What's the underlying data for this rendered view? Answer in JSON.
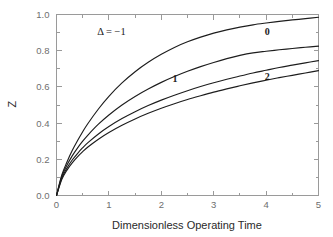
{
  "chart_data": {
    "type": "line",
    "title": "",
    "xlabel": "Dimensionless Operating Time",
    "ylabel": "Z",
    "xlim": [
      0,
      5
    ],
    "ylim": [
      0,
      1.0
    ],
    "grid": false,
    "legend": "inline-curve-labels",
    "x_ticks": [
      "0",
      "1",
      "2",
      "3",
      "4",
      "5"
    ],
    "x_tick_values": [
      0,
      1,
      2,
      3,
      4,
      5
    ],
    "x_minor_tick_values": [
      0.5,
      1.5,
      2.5,
      3.5,
      4.5
    ],
    "y_ticks": [
      "0.0",
      "0.2",
      "0.4",
      "0.6",
      "0.8",
      "1.0"
    ],
    "y_tick_values": [
      0.0,
      0.2,
      0.4,
      0.6,
      0.8,
      1.0
    ],
    "y_minor_tick_values": [
      0.1,
      0.3,
      0.5,
      0.7,
      0.9
    ],
    "x": [
      0,
      0.1,
      0.2,
      0.3,
      0.4,
      0.5,
      0.6,
      0.8,
      1.0,
      1.25,
      1.5,
      1.75,
      2.0,
      2.25,
      2.5,
      2.75,
      3.0,
      3.25,
      3.5,
      3.75,
      4.0,
      4.25,
      4.5,
      4.75,
      5.0
    ],
    "series": [
      {
        "name": "Δ = −1",
        "label": "Δ = −1",
        "label_x": 1.05,
        "label_y": 0.885,
        "color": "#1d1d1d",
        "values": [
          0.0,
          0.112,
          0.185,
          0.248,
          0.302,
          0.352,
          0.398,
          0.478,
          0.548,
          0.622,
          0.684,
          0.736,
          0.78,
          0.818,
          0.849,
          0.875,
          0.897,
          0.915,
          0.93,
          0.943,
          0.953,
          0.962,
          0.97,
          0.977,
          0.985
        ]
      },
      {
        "name": "0",
        "label": "0",
        "label_x": 4.02,
        "label_y": 0.888,
        "color": "#1d1d1d",
        "values": [
          0.0,
          0.095,
          0.152,
          0.196,
          0.232,
          0.264,
          0.292,
          0.34,
          0.381,
          0.425,
          0.463,
          0.497,
          0.527,
          0.554,
          0.579,
          0.602,
          0.623,
          0.642,
          0.66,
          0.677,
          0.692,
          0.707,
          0.72,
          0.733,
          0.745
        ]
      },
      {
        "name": "1",
        "label": "1",
        "label_x": 2.26,
        "label_y": 0.625,
        "color": "#1d1d1d",
        "values": [
          0.0,
          0.104,
          0.168,
          0.219,
          0.262,
          0.3,
          0.334,
          0.394,
          0.445,
          0.5,
          0.547,
          0.588,
          0.625,
          0.657,
          0.686,
          0.712,
          0.735,
          0.756,
          0.774,
          0.788,
          0.797,
          0.805,
          0.812,
          0.819,
          0.825
        ]
      },
      {
        "name": "2",
        "label": "2",
        "label_x": 4.02,
        "label_y": 0.636,
        "color": "#1d1d1d",
        "values": [
          0.0,
          0.088,
          0.14,
          0.18,
          0.213,
          0.242,
          0.268,
          0.311,
          0.348,
          0.388,
          0.423,
          0.454,
          0.482,
          0.507,
          0.53,
          0.551,
          0.571,
          0.589,
          0.606,
          0.622,
          0.637,
          0.651,
          0.664,
          0.677,
          0.69
        ]
      }
    ]
  },
  "axes": {
    "frame_color": "#9a9a9a",
    "tick_label_color": "#6e6e6e",
    "axis_title_color": "#2a2a2a"
  }
}
